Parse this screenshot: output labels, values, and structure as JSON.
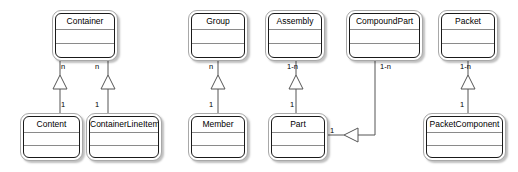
{
  "diagram": {
    "type": "uml-class-diagram",
    "background_color": "#ffffff",
    "line_color": "#555555",
    "box_border_color": "#1a1a1a",
    "classes": [
      {
        "id": "container",
        "name": "Container",
        "x": 52,
        "y": 10,
        "w": 66,
        "h": 51
      },
      {
        "id": "content",
        "name": "Content",
        "x": 20,
        "y": 113,
        "w": 63,
        "h": 48
      },
      {
        "id": "containerlineitem",
        "name": "ContainerLineItem",
        "x": 86,
        "y": 113,
        "w": 76,
        "h": 48
      },
      {
        "id": "group",
        "name": "Group",
        "x": 188,
        "y": 10,
        "w": 60,
        "h": 51
      },
      {
        "id": "member",
        "name": "Member",
        "x": 188,
        "y": 113,
        "w": 60,
        "h": 48
      },
      {
        "id": "assembly",
        "name": "Assembly",
        "x": 265,
        "y": 10,
        "w": 60,
        "h": 51
      },
      {
        "id": "part",
        "name": "Part",
        "x": 268,
        "y": 113,
        "w": 60,
        "h": 48
      },
      {
        "id": "compoundpart",
        "name": "CompoundPart",
        "x": 346,
        "y": 10,
        "w": 77,
        "h": 51
      },
      {
        "id": "packet",
        "name": "Packet",
        "x": 438,
        "y": 10,
        "w": 60,
        "h": 51
      },
      {
        "id": "packetcomponent",
        "name": "PacketComponent",
        "x": 423,
        "y": 113,
        "w": 83,
        "h": 48
      }
    ],
    "relationships": [
      {
        "id": "container-content",
        "from": "container",
        "to": "content",
        "from_multiplicity": "n",
        "to_multiplicity": "1",
        "arrow": "hollow-triangle-up"
      },
      {
        "id": "container-containerlineitem",
        "from": "container",
        "to": "containerlineitem",
        "from_multiplicity": "n",
        "to_multiplicity": "1",
        "arrow": "hollow-triangle-up"
      },
      {
        "id": "group-member",
        "from": "group",
        "to": "member",
        "from_multiplicity": "n",
        "to_multiplicity": "1",
        "arrow": "hollow-triangle-up"
      },
      {
        "id": "assembly-part",
        "from": "assembly",
        "to": "part",
        "from_multiplicity": "1-n",
        "to_multiplicity": "1",
        "arrow": "hollow-triangle-up"
      },
      {
        "id": "compoundpart-part",
        "from": "compoundpart",
        "to": "part",
        "from_multiplicity": "1-n",
        "to_multiplicity": "1",
        "arrow": "hollow-triangle-right"
      },
      {
        "id": "packet-packetcomponent",
        "from": "packet",
        "to": "packetcomponent",
        "from_multiplicity": "1-n",
        "to_multiplicity": "1",
        "arrow": "hollow-triangle-up"
      }
    ],
    "multiplicity_labels": [
      {
        "id": "m-container-content-n",
        "text": "n",
        "x": 61,
        "y": 62
      },
      {
        "id": "m-container-cli-n",
        "text": "n",
        "x": 95,
        "y": 62
      },
      {
        "id": "m-content-1",
        "text": "1",
        "x": 61,
        "y": 100
      },
      {
        "id": "m-cli-1",
        "text": "1",
        "x": 95,
        "y": 100
      },
      {
        "id": "m-group-n",
        "text": "n",
        "x": 209,
        "y": 62
      },
      {
        "id": "m-member-1",
        "text": "1",
        "x": 209,
        "y": 100
      },
      {
        "id": "m-assembly-1n",
        "text": "1-n",
        "x": 287,
        "y": 62
      },
      {
        "id": "m-part-1",
        "text": "1",
        "x": 290,
        "y": 100
      },
      {
        "id": "m-compoundpart-1n",
        "text": "1-n",
        "x": 380,
        "y": 62
      },
      {
        "id": "m-part-right-1",
        "text": "1",
        "x": 330,
        "y": 126
      },
      {
        "id": "m-packet-1n",
        "text": "1-n",
        "x": 460,
        "y": 62
      },
      {
        "id": "m-packetcomponent-1",
        "text": "1",
        "x": 460,
        "y": 100
      }
    ]
  }
}
